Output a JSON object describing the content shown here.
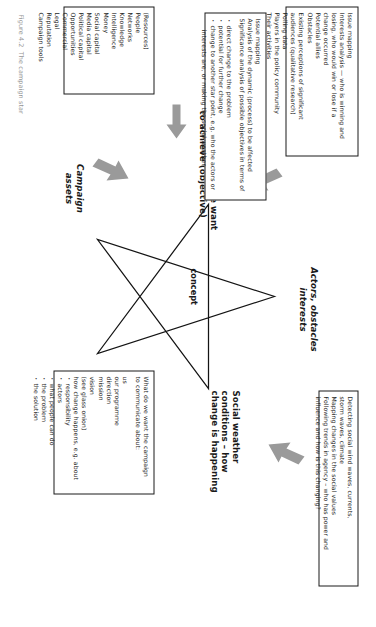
{
  "figure": {
    "caption": "Figure 4.2  The campaign star",
    "center_label": "concept"
  },
  "star_points": [
    {
      "id": "ambition",
      "label": "Ambition: what we want\nto achieve (objective)",
      "style": "bold"
    },
    {
      "id": "actors",
      "label": "Actors, obstacles\ninterests",
      "style": "italic"
    },
    {
      "id": "social",
      "label": "Social weather\nconditions – how\nchange is happening",
      "style": "bold"
    },
    {
      "id": "communication",
      "label": "Communication\ndesires",
      "style": "italic"
    },
    {
      "id": "assets",
      "label": "Campaign\nassets",
      "style": "italic"
    }
  ],
  "boxes": {
    "actors_interests": {
      "name": "Actors, obstacles, interests box",
      "lines": [
        {
          "type": "plain",
          "text": "Issue mapping"
        },
        {
          "type": "plain",
          "text": "Interests analysis — who is winning and"
        },
        {
          "type": "plain",
          "text": "losing, who would win or lose if a"
        },
        {
          "type": "plain",
          "text": "change occurred"
        },
        {
          "type": "plain",
          "text": "Potential allies"
        },
        {
          "type": "plain",
          "text": "Obstacles"
        },
        {
          "type": "plain",
          "text": "Existing perceptions of significant"
        },
        {
          "type": "plain",
          "text": "audiences (qualitative research)"
        },
        {
          "type": "plain",
          "text": "Polling data"
        },
        {
          "type": "plain",
          "text": "Players in the policy community"
        },
        {
          "type": "plain",
          "text": "Their activities"
        }
      ]
    },
    "social_weather": {
      "name": "Social weather conditions box",
      "lines": [
        {
          "type": "plain",
          "text": "Detecting social wind waves, currents,"
        },
        {
          "type": "plain",
          "text": "storm waves, climate"
        },
        {
          "type": "plain",
          "text": "Mapping changes in the social values"
        },
        {
          "type": "plain",
          "text": "Following trends in agency – who has power and"
        },
        {
          "type": "plain",
          "text": "influence and how is this changing?"
        }
      ]
    },
    "ambition": {
      "name": "Ambition / objective box",
      "lines": [
        {
          "type": "plain",
          "text": "Issue mapping"
        },
        {
          "type": "plain",
          "text": "Analysis of the dynamic (process) to be affected"
        },
        {
          "type": "plain",
          "text": "Significance analysis of possible objectives in terms of"
        },
        {
          "type": "spacer",
          "text": ""
        },
        {
          "type": "bullet",
          "text": "direct change to the problem"
        },
        {
          "type": "bullet",
          "text": "potential for further change"
        },
        {
          "type": "bullet",
          "text": "change to another star point, e.g. who the actors or"
        },
        {
          "type": "plain",
          "text": "  interests are, or making the social weather"
        }
      ]
    },
    "campaign_assets": {
      "name": "Campaign assets box",
      "lines": [
        {
          "type": "plain",
          "text": "(Resources)"
        },
        {
          "type": "plain",
          "text": "People"
        },
        {
          "type": "plain",
          "text": "Networks"
        },
        {
          "type": "plain",
          "text": "Knowledge"
        },
        {
          "type": "plain",
          "text": "Intelligence"
        },
        {
          "type": "plain",
          "text": "Money"
        },
        {
          "type": "plain",
          "text": "Social capital"
        },
        {
          "type": "plain",
          "text": "Media capital"
        },
        {
          "type": "plain",
          "text": "Political capital"
        },
        {
          "type": "plain",
          "text": "Opportunities"
        },
        {
          "type": "plain",
          "text": "Commercial"
        },
        {
          "type": "plain",
          "text": "Legal"
        },
        {
          "type": "plain",
          "text": "Reputation"
        },
        {
          "type": "plain",
          "text": "Campaign tools"
        }
      ]
    },
    "communication_desires": {
      "name": "Communication desires box",
      "lines": [
        {
          "type": "plain",
          "text": "What do we want the campaign"
        },
        {
          "type": "plain",
          "text": "to communicate about:"
        },
        {
          "type": "spacer",
          "text": ""
        },
        {
          "type": "plain",
          "text": "us"
        },
        {
          "type": "plain",
          "text": "our programme"
        },
        {
          "type": "plain",
          "text": "direction"
        },
        {
          "type": "plain",
          "text": "mission"
        },
        {
          "type": "plain",
          "text": "vision"
        },
        {
          "type": "plain",
          "text": "(see glass onion)"
        },
        {
          "type": "plain",
          "text": "how change happens, e.g. about"
        },
        {
          "type": "bullet",
          "text": "responsibility"
        },
        {
          "type": "bullet",
          "text": "actors"
        },
        {
          "type": "bullet",
          "text": "what people can do"
        },
        {
          "type": "bullet",
          "text": "the problem"
        },
        {
          "type": "bullet",
          "text": "the solution"
        }
      ]
    }
  },
  "colors": {
    "ink": "#1a1a1a",
    "arrow": "#9a9a9a",
    "paper": "#ffffff"
  }
}
